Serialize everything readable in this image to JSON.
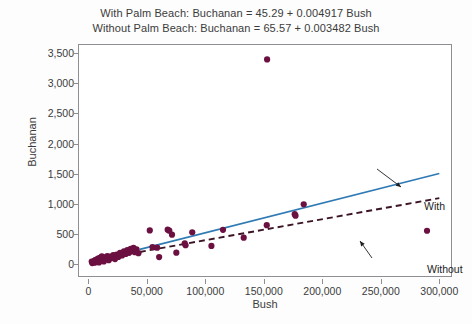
{
  "chart_data": {
    "type": "scatter",
    "title": "",
    "title_lines": [
      "With Palm Beach: Buchanan = 45.29 + 0.004917 Bush",
      "Without Palm Beach: Buchanan = 65.57 + 0.003482 Bush"
    ],
    "xlabel": "Bush",
    "ylabel": "Buchanan",
    "xlim": [
      -8000,
      310000
    ],
    "ylim": [
      -180,
      3650
    ],
    "xticks": [
      0,
      50000,
      100000,
      150000,
      200000,
      250000,
      300000
    ],
    "xticklabels": [
      "0",
      "50,000",
      "100,000",
      "150,000",
      "200,000",
      "250,000",
      "300,000"
    ],
    "yticks": [
      0,
      500,
      1000,
      1500,
      2000,
      2500,
      3000,
      3500
    ],
    "yticklabels": [
      "0",
      "500",
      "1,000",
      "1,500",
      "2,000",
      "2,500",
      "3,000",
      "3,500"
    ],
    "grid": false,
    "legend_position": "inline-annotations",
    "marker_color": "#6b1040",
    "points": [
      {
        "x": 2873,
        "y": 60
      },
      {
        "x": 3300,
        "y": 35
      },
      {
        "x": 4200,
        "y": 52
      },
      {
        "x": 4985,
        "y": 73
      },
      {
        "x": 5400,
        "y": 40
      },
      {
        "x": 6200,
        "y": 88
      },
      {
        "x": 7200,
        "y": 65
      },
      {
        "x": 8200,
        "y": 110
      },
      {
        "x": 9100,
        "y": 45
      },
      {
        "x": 9800,
        "y": 120
      },
      {
        "x": 10800,
        "y": 78
      },
      {
        "x": 11500,
        "y": 145
      },
      {
        "x": 12400,
        "y": 95
      },
      {
        "x": 13200,
        "y": 60
      },
      {
        "x": 14100,
        "y": 130
      },
      {
        "x": 15100,
        "y": 105
      },
      {
        "x": 16200,
        "y": 152
      },
      {
        "x": 17400,
        "y": 82
      },
      {
        "x": 18600,
        "y": 140
      },
      {
        "x": 19900,
        "y": 118
      },
      {
        "x": 21300,
        "y": 165
      },
      {
        "x": 22800,
        "y": 100
      },
      {
        "x": 24200,
        "y": 175
      },
      {
        "x": 25600,
        "y": 135
      },
      {
        "x": 27100,
        "y": 205
      },
      {
        "x": 28800,
        "y": 160
      },
      {
        "x": 30400,
        "y": 228
      },
      {
        "x": 31900,
        "y": 185
      },
      {
        "x": 33300,
        "y": 248
      },
      {
        "x": 34800,
        "y": 205
      },
      {
        "x": 36200,
        "y": 272
      },
      {
        "x": 37400,
        "y": 232
      },
      {
        "x": 38600,
        "y": 288
      },
      {
        "x": 39800,
        "y": 215
      },
      {
        "x": 41200,
        "y": 262
      },
      {
        "x": 42800,
        "y": 198
      },
      {
        "x": 52500,
        "y": 575
      },
      {
        "x": 54800,
        "y": 300
      },
      {
        "x": 58800,
        "y": 290
      },
      {
        "x": 60500,
        "y": 133
      },
      {
        "x": 67800,
        "y": 588
      },
      {
        "x": 69200,
        "y": 572
      },
      {
        "x": 71500,
        "y": 505
      },
      {
        "x": 75200,
        "y": 207
      },
      {
        "x": 82400,
        "y": 360
      },
      {
        "x": 83100,
        "y": 330
      },
      {
        "x": 88800,
        "y": 545
      },
      {
        "x": 105200,
        "y": 318
      },
      {
        "x": 115100,
        "y": 585
      },
      {
        "x": 132800,
        "y": 455
      },
      {
        "x": 152800,
        "y": 3411
      },
      {
        "x": 152500,
        "y": 663
      },
      {
        "x": 176400,
        "y": 845
      },
      {
        "x": 177100,
        "y": 820
      },
      {
        "x": 184100,
        "y": 1010
      },
      {
        "x": 289500,
        "y": 570
      }
    ],
    "series": [
      {
        "name": "With",
        "type": "line",
        "style": "solid",
        "color": "#2f7ab5",
        "intercept": 45.29,
        "slope": 0.004917,
        "x_start": 44000,
        "x_end": 300000,
        "annotation": "With"
      },
      {
        "name": "Without",
        "type": "line",
        "style": "dashed",
        "color": "#3b1426",
        "intercept": 65.57,
        "slope": 0.003482,
        "x_start": 44000,
        "x_end": 300000,
        "annotation": "Without"
      }
    ]
  }
}
